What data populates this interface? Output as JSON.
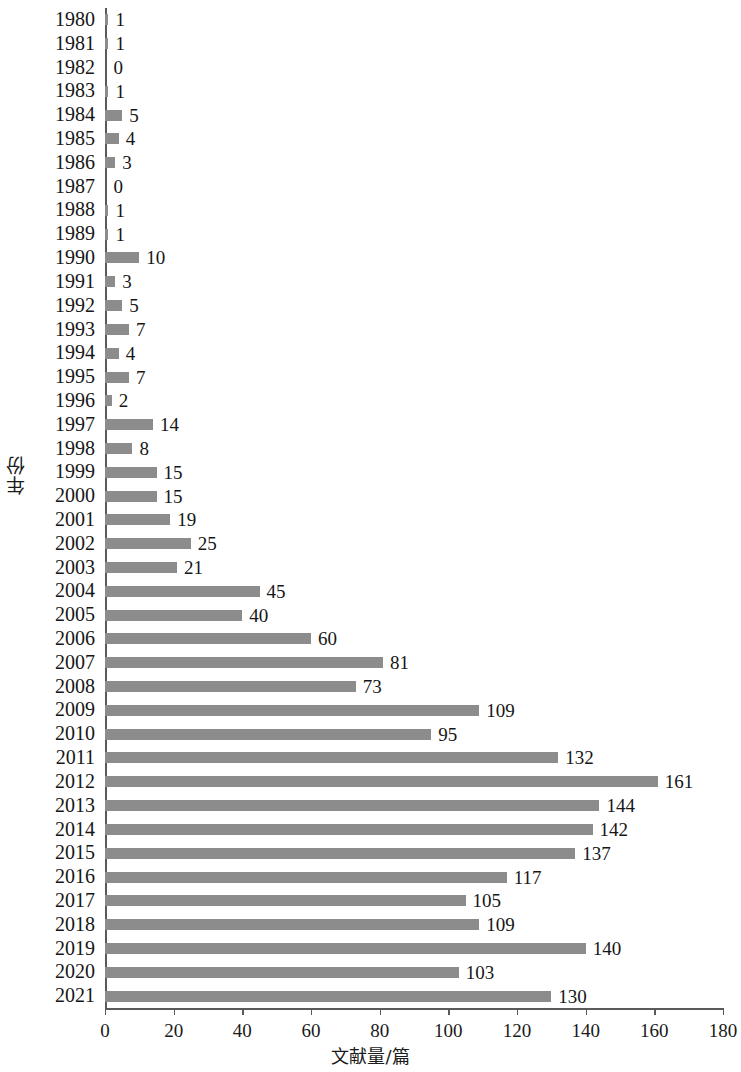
{
  "chart_data": {
    "type": "bar",
    "orientation": "horizontal",
    "title": "",
    "xlabel": "文献量/篇",
    "ylabel": "年份",
    "xlim": [
      0,
      180
    ],
    "xticks": [
      0,
      20,
      40,
      60,
      80,
      100,
      120,
      140,
      160,
      180
    ],
    "grid": false,
    "legend": null,
    "bar_color": "#8c8c8c",
    "axis_color": "#5a5a5a",
    "text_color": "#161616",
    "categories": [
      "1980",
      "1981",
      "1982",
      "1983",
      "1984",
      "1985",
      "1986",
      "1987",
      "1988",
      "1989",
      "1990",
      "1991",
      "1992",
      "1993",
      "1994",
      "1995",
      "1996",
      "1997",
      "1998",
      "1999",
      "2000",
      "2001",
      "2002",
      "2003",
      "2004",
      "2005",
      "2006",
      "2007",
      "2008",
      "2009",
      "2010",
      "2011",
      "2012",
      "2013",
      "2014",
      "2015",
      "2016",
      "2017",
      "2018",
      "2019",
      "2020",
      "2021"
    ],
    "values": [
      1,
      1,
      0,
      1,
      5,
      4,
      3,
      0,
      1,
      1,
      10,
      3,
      5,
      7,
      4,
      7,
      2,
      14,
      8,
      15,
      15,
      19,
      25,
      21,
      45,
      40,
      60,
      81,
      73,
      109,
      95,
      132,
      161,
      144,
      142,
      137,
      117,
      105,
      109,
      140,
      103,
      130
    ],
    "value_labels": [
      "1",
      "1",
      "0",
      "1",
      "5",
      "4",
      "3",
      "0",
      "1",
      "1",
      "10",
      "3",
      "5",
      "7",
      "4",
      "7",
      "2",
      "14",
      "8",
      "15",
      "15",
      "19",
      "25",
      "21",
      "45",
      "40",
      "60",
      "81",
      "73",
      "109",
      "95",
      "132",
      "161",
      "144",
      "142",
      "137",
      "117",
      "105",
      "109",
      "140",
      "103",
      "130"
    ]
  }
}
